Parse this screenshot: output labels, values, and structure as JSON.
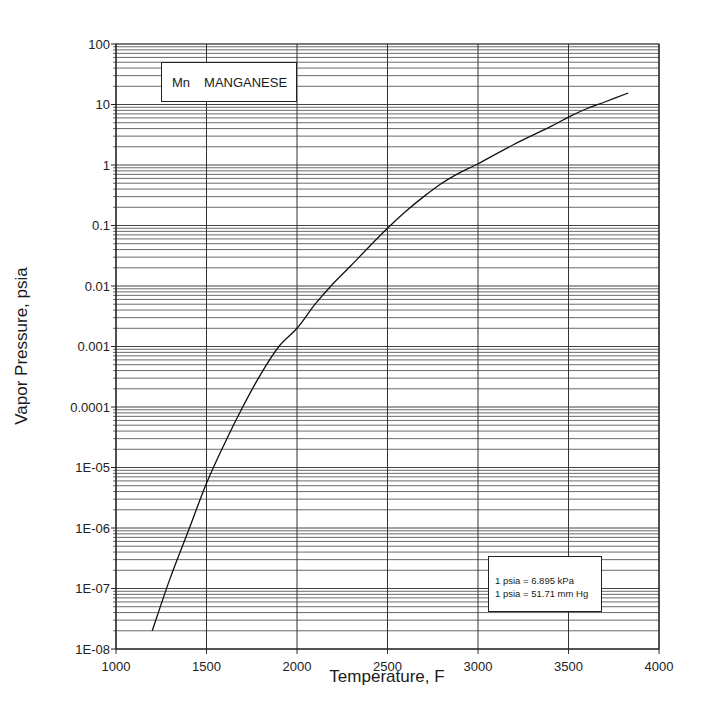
{
  "chart_data": {
    "type": "line",
    "title": "Mn  MANGANESE",
    "element_symbol": "Mn",
    "element_name": "MANGANESE",
    "xlabel": "Temperature, F",
    "ylabel": "Vapor Pressure, psia",
    "xlim": [
      1000,
      4000
    ],
    "ylim": [
      1e-08,
      100
    ],
    "yscale": "log",
    "grid": true,
    "x_ticks": [
      "1000",
      "1500",
      "2000",
      "2500",
      "3000",
      "3500",
      "4000"
    ],
    "y_ticks": [
      "100",
      "10",
      "1",
      "0.1",
      "0.01",
      "0.001",
      "0.0001",
      "1E-05",
      "1E-06",
      "1E-07",
      "1E-08"
    ],
    "series": [
      {
        "name": "Mn vapor pressure",
        "x": [
          1200,
          1300,
          1400,
          1500,
          1600,
          1700,
          1800,
          1900,
          2000,
          2100,
          2200,
          2300,
          2400,
          2500,
          2600,
          2700,
          2800,
          2900,
          3000,
          3200,
          3400,
          3500,
          3600,
          3700,
          3830
        ],
        "y": [
          2e-08,
          1.5e-07,
          9e-07,
          5.5e-06,
          2.5e-05,
          0.0001,
          0.00035,
          0.001,
          0.002,
          0.005,
          0.011,
          0.022,
          0.045,
          0.09,
          0.17,
          0.3,
          0.5,
          0.75,
          1.05,
          2.2,
          4.3,
          6.2,
          8.5,
          11,
          15.5
        ]
      }
    ],
    "annotations": [
      "1 psia = 6.895 kPa",
      "1 psia = 51.71 mm Hg"
    ]
  },
  "legend_box": {
    "symbol": "Mn",
    "name": "MANGANESE"
  },
  "conversion_box": {
    "line1": "1 psia = 6.895 kPa",
    "line2": "1 psia = 51.71 mm Hg"
  },
  "axes": {
    "xlabel": "Temperature, F",
    "ylabel": "Vapor Pressure, psia"
  }
}
